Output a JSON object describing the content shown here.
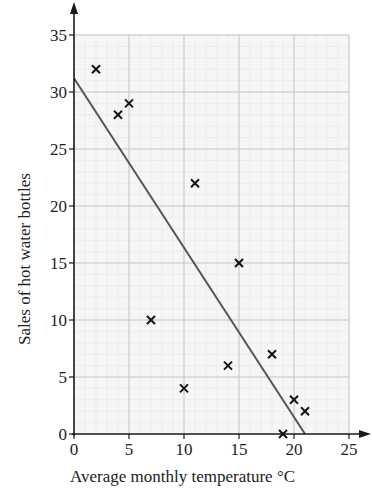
{
  "chart_data": {
    "type": "scatter",
    "title": "",
    "xlabel": "Average monthly temperature °C",
    "ylabel": "Sales of hot water bottles",
    "xlim": [
      0,
      25
    ],
    "ylim": [
      0,
      35
    ],
    "x_ticks": [
      0,
      5,
      10,
      15,
      20,
      25
    ],
    "y_ticks": [
      0,
      5,
      10,
      15,
      20,
      25,
      30,
      35
    ],
    "grid": true,
    "marker": "x",
    "series": [
      {
        "name": "data",
        "points": [
          {
            "x": 2,
            "y": 32
          },
          {
            "x": 4,
            "y": 28
          },
          {
            "x": 5,
            "y": 29
          },
          {
            "x": 7,
            "y": 10
          },
          {
            "x": 10,
            "y": 4
          },
          {
            "x": 11,
            "y": 22
          },
          {
            "x": 14,
            "y": 6
          },
          {
            "x": 15,
            "y": 15
          },
          {
            "x": 18,
            "y": 7
          },
          {
            "x": 19,
            "y": 0
          },
          {
            "x": 20,
            "y": 3
          },
          {
            "x": 21,
            "y": 2
          }
        ]
      }
    ],
    "line_of_best_fit": {
      "x1": 0,
      "y1": 31.2,
      "x2": 21,
      "y2": 0
    }
  },
  "colors": {
    "axis": "#1a1a1a",
    "major_grid": "#c8c8c8",
    "minor_grid": "#ececec",
    "plot_bg": "#f6f6f6",
    "marker": "#111111",
    "fit_line": "#555555"
  }
}
